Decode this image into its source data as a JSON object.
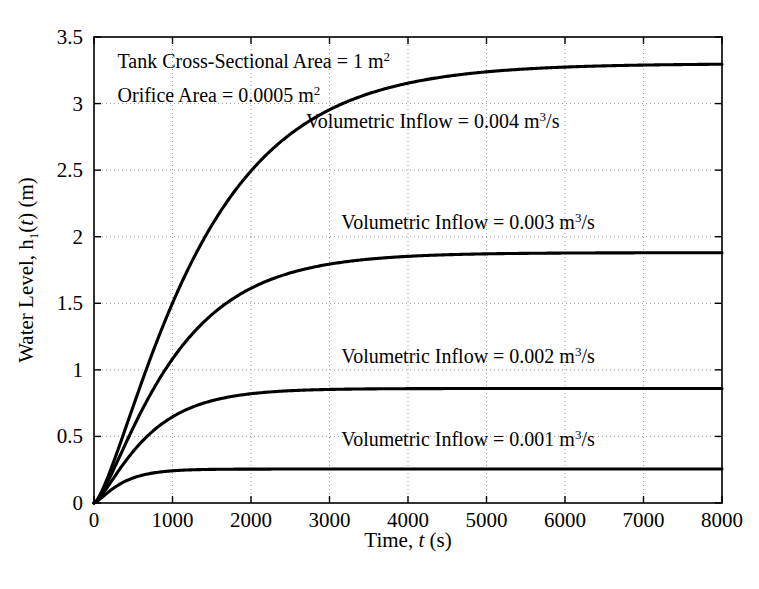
{
  "chart_data": {
    "type": "line",
    "title": "",
    "xlabel": "Time, t (s)",
    "ylabel": "Water Level, h₁(t) (m)",
    "xlim": [
      0,
      8000
    ],
    "ylim": [
      0,
      3.5
    ],
    "grid": true,
    "grid_style": "dotted",
    "legend_position": "inline-annotations",
    "x_ticks": [
      "0",
      "1000",
      "2000",
      "3000",
      "4000",
      "5000",
      "6000",
      "7000",
      "8000"
    ],
    "x_tick_values": [
      0,
      1000,
      2000,
      3000,
      4000,
      5000,
      6000,
      7000,
      8000
    ],
    "y_ticks": [
      "0",
      "0.5",
      "1",
      "1.5",
      "2",
      "2.5",
      "3",
      "3.5"
    ],
    "y_tick_values": [
      0,
      0.5,
      1,
      1.5,
      2,
      2.5,
      3,
      3.5
    ],
    "series": [
      {
        "name": "Volumetric Inflow = 0.004 m^3/s",
        "inflow": 0.004,
        "steady_state": 3.3,
        "time_constant": 1150,
        "color": "#000000",
        "x": [
          0,
          200,
          400,
          600,
          800,
          1000,
          1250,
          1500,
          1750,
          2000,
          2500,
          3000,
          3500,
          4000,
          4500,
          5000,
          5500,
          6000,
          6500,
          7000,
          7500,
          8000
        ],
        "y": [
          0,
          0.47,
          0.88,
          1.23,
          1.53,
          1.79,
          2.06,
          2.3,
          2.49,
          2.65,
          2.88,
          3.04,
          3.14,
          3.2,
          3.24,
          3.27,
          3.28,
          3.29,
          3.29,
          3.3,
          3.3,
          3.3
        ]
      },
      {
        "name": "Volumetric Inflow = 0.003 m^3/s",
        "inflow": 0.003,
        "steady_state": 1.88,
        "time_constant": 870,
        "color": "#000000",
        "x": [
          0,
          200,
          400,
          600,
          800,
          1000,
          1250,
          1500,
          1750,
          2000,
          2500,
          3000,
          3500,
          4000,
          4500,
          5000,
          5500,
          6000,
          6500,
          7000,
          7500,
          8000
        ],
        "y": [
          0,
          0.36,
          0.66,
          0.9,
          1.09,
          1.25,
          1.42,
          1.54,
          1.63,
          1.7,
          1.78,
          1.83,
          1.85,
          1.87,
          1.87,
          1.88,
          1.88,
          1.88,
          1.88,
          1.88,
          1.88,
          1.88
        ]
      },
      {
        "name": "Volumetric Inflow = 0.002 m^3/s",
        "inflow": 0.002,
        "steady_state": 0.86,
        "time_constant": 580,
        "color": "#000000",
        "x": [
          0,
          200,
          400,
          600,
          800,
          1000,
          1250,
          1500,
          1750,
          2000,
          2500,
          3000,
          3500,
          4000,
          4500,
          5000,
          5500,
          6000,
          6500,
          7000,
          7500,
          8000
        ],
        "y": [
          0,
          0.24,
          0.42,
          0.55,
          0.64,
          0.7,
          0.76,
          0.79,
          0.82,
          0.83,
          0.85,
          0.855,
          0.86,
          0.86,
          0.86,
          0.86,
          0.86,
          0.86,
          0.86,
          0.86,
          0.86,
          0.86
        ]
      },
      {
        "name": "Volumetric Inflow = 0.001 m^3/s",
        "inflow": 0.001,
        "steady_state": 0.255,
        "time_constant": 300,
        "color": "#000000",
        "x": [
          0,
          200,
          400,
          600,
          800,
          1000,
          1250,
          1500,
          1750,
          2000,
          2500,
          3000,
          3500,
          4000,
          4500,
          5000,
          5500,
          6000,
          6500,
          7000,
          7500,
          8000
        ],
        "y": [
          0,
          0.12,
          0.19,
          0.225,
          0.24,
          0.248,
          0.252,
          0.254,
          0.255,
          0.255,
          0.255,
          0.255,
          0.255,
          0.255,
          0.255,
          0.255,
          0.255,
          0.255,
          0.255,
          0.255,
          0.255,
          0.255
        ]
      }
    ],
    "annotations": [
      {
        "id": "tank-area",
        "text_prefix": "Tank Cross-Sectional Area = 1 m",
        "sup": "2",
        "text_suffix": "",
        "x_data": 300,
        "y_data": 3.27
      },
      {
        "id": "orifice-area",
        "text_prefix": "Orifice Area = 0.0005 m",
        "sup": "2",
        "text_suffix": "",
        "x_data": 300,
        "y_data": 3.01
      },
      {
        "id": "label-inflow-004",
        "text_prefix": "Volumetric Inflow = 0.004 m",
        "sup": "3",
        "text_suffix": "/s",
        "x_data": 2700,
        "y_data": 2.82
      },
      {
        "id": "label-inflow-003",
        "text_prefix": "Volumetric Inflow = 0.003 m",
        "sup": "3",
        "text_suffix": "/s",
        "x_data": 3150,
        "y_data": 2.06
      },
      {
        "id": "label-inflow-002",
        "text_prefix": "Volumetric Inflow = 0.002 m",
        "sup": "3",
        "text_suffix": "/s",
        "x_data": 3150,
        "y_data": 1.05
      },
      {
        "id": "label-inflow-001",
        "text_prefix": "Volumetric Inflow = 0.001 m",
        "sup": "3",
        "text_suffix": "/s",
        "x_data": 3150,
        "y_data": 0.43
      }
    ]
  },
  "axes": {
    "x_title_main": "Time, ",
    "x_title_italic": "t",
    "x_title_unit": " (s)",
    "y_title_main": "Water Level, h",
    "y_title_sub": "1",
    "y_title_paren_open": "(",
    "y_title_italic": "t",
    "y_title_paren_close": ") (m)"
  },
  "style": {
    "line_color": "#000000",
    "axis_color": "#000000",
    "grid_color": "#999999",
    "background": "#ffffff"
  }
}
